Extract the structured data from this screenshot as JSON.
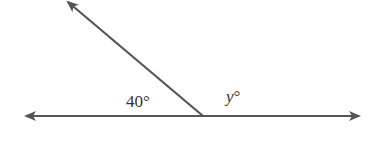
{
  "diagram": {
    "type": "angles-on-a-line",
    "line_color": "#555555",
    "background": "#ffffff",
    "labels": {
      "left_angle": "40°",
      "right_angle_var": "y",
      "right_angle_deg": "°"
    },
    "geometry": {
      "vertex": [
        203,
        116
      ],
      "line_left_end": [
        24,
        116
      ],
      "line_right_end": [
        360,
        116
      ],
      "ray_end": [
        66,
        0
      ]
    }
  }
}
